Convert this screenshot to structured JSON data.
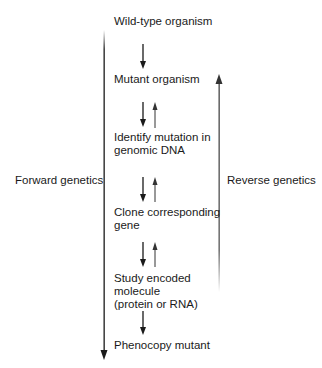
{
  "diagram": {
    "type": "flowchart",
    "steps": [
      {
        "id": "wild_type",
        "lines": [
          "Wild-type organism"
        ]
      },
      {
        "id": "mutant",
        "lines": [
          "Mutant organism"
        ]
      },
      {
        "id": "identify",
        "lines": [
          "Identify mutation in",
          "genomic DNA"
        ]
      },
      {
        "id": "clone",
        "lines": [
          "Clone corresponding",
          "gene"
        ]
      },
      {
        "id": "study",
        "lines": [
          "Study encoded",
          "molecule",
          "(protein or RNA)"
        ]
      },
      {
        "id": "phenocopy",
        "lines": [
          "Phenocopy mutant"
        ]
      }
    ],
    "side_labels": {
      "forward": "Forward genetics",
      "reverse": "Reverse genetics"
    },
    "colors": {
      "text": "#1a1a1a",
      "arrow": "#1a1a1a",
      "reverse_arrow": "#444444"
    }
  }
}
